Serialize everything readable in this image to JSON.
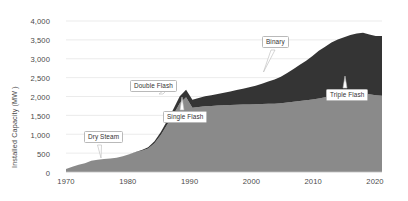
{
  "chart_data": {
    "type": "area",
    "title": "",
    "xlabel": "",
    "ylabel": "Installed Capacity (MW )",
    "xlim": [
      1970,
      2020
    ],
    "ylim": [
      0,
      4000
    ],
    "grid": true,
    "legend_position": "none",
    "stacked": true,
    "y_ticks": [
      "0",
      "500",
      "1,000",
      "1,500",
      "2,000",
      "2,500",
      "3,000",
      "3,500",
      "4,000"
    ],
    "y_tick_values": [
      0,
      500,
      1000,
      1500,
      2000,
      2500,
      3000,
      3500,
      4000
    ],
    "x_ticks": [
      "1970",
      "1980",
      "1990",
      "2000",
      "2010",
      "2020"
    ],
    "x_tick_values": [
      1970,
      1980,
      1990,
      2000,
      2010,
      2020
    ],
    "x": [
      1970,
      1971,
      1972,
      1973,
      1974,
      1975,
      1976,
      1977,
      1978,
      1979,
      1980,
      1981,
      1982,
      1983,
      1984,
      1985,
      1986,
      1987,
      1988,
      1989,
      1990,
      1991,
      1992,
      1993,
      1994,
      1995,
      1996,
      1997,
      1998,
      1999,
      2000,
      2001,
      2002,
      2003,
      2004,
      2005,
      2006,
      2007,
      2008,
      2009,
      2010,
      2011,
      2012,
      2013,
      2014,
      2015,
      2016,
      2017,
      2018,
      2019,
      2020
    ],
    "series": [
      {
        "name": "Flash and Dry Steam (lower band)",
        "color": "#8a8a8a",
        "values": [
          82,
          140,
          190,
          235,
          300,
          325,
          345,
          360,
          380,
          420,
          470,
          520,
          560,
          620,
          760,
          980,
          1250,
          1520,
          1820,
          1980,
          1700,
          1720,
          1740,
          1750,
          1760,
          1770,
          1775,
          1780,
          1785,
          1790,
          1795,
          1800,
          1805,
          1810,
          1820,
          1840,
          1860,
          1880,
          1900,
          1920,
          1950,
          1980,
          2010,
          2030,
          2050,
          2070,
          2080,
          2090,
          2060,
          2030,
          2020
        ]
      },
      {
        "name": "Binary (upper band)",
        "color": "#343434",
        "values": [
          0,
          0,
          0,
          0,
          0,
          0,
          0,
          0,
          0,
          0,
          0,
          10,
          20,
          35,
          55,
          80,
          110,
          150,
          185,
          200,
          215,
          240,
          265,
          285,
          305,
          330,
          360,
          390,
          420,
          455,
          490,
          540,
          590,
          640,
          700,
          780,
          870,
          960,
          1050,
          1150,
          1260,
          1340,
          1420,
          1480,
          1520,
          1560,
          1590,
          1600,
          1580,
          1570,
          1580
        ]
      }
    ],
    "totals": [
      82,
      140,
      190,
      235,
      300,
      325,
      345,
      360,
      380,
      420,
      470,
      530,
      580,
      655,
      815,
      1060,
      1360,
      1670,
      2005,
      2180,
      1915,
      1960,
      2005,
      2035,
      2065,
      2100,
      2135,
      2170,
      2205,
      2245,
      2285,
      2340,
      2395,
      2450,
      2520,
      2620,
      2730,
      2840,
      2950,
      3070,
      3210,
      3320,
      3430,
      3510,
      3570,
      3630,
      3670,
      3690,
      3640,
      3600,
      3600
    ],
    "annotations": [
      {
        "id": "dry-steam",
        "label": "Dry Steam"
      },
      {
        "id": "double-flash",
        "label": "Double Flash"
      },
      {
        "id": "single-flash",
        "label": "Single Flash"
      },
      {
        "id": "binary",
        "label": "Binary"
      },
      {
        "id": "triple-flash",
        "label": "Triple Flash"
      }
    ],
    "colors": {
      "lower_band": "#8a8a8a",
      "upper_band": "#343434",
      "grid": "#e2e2e2",
      "text": "#4a4a4a",
      "background": "#ffffff"
    }
  }
}
